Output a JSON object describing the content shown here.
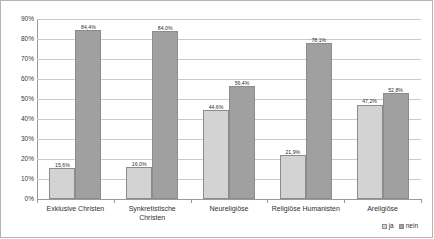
{
  "chart_data": {
    "type": "bar",
    "title": "",
    "subtitle": "",
    "xlabel": "",
    "ylabel": "",
    "ylim": [
      0,
      90
    ],
    "ytick_labels": [
      "90%",
      "80%",
      "70%",
      "60%",
      "50%",
      "40%",
      "30%",
      "20%",
      "10%",
      "0%"
    ],
    "ytick_values": [
      90,
      80,
      70,
      60,
      50,
      40,
      30,
      20,
      10,
      0
    ],
    "grid": true,
    "legend_position": "bottom-right",
    "categories": [
      "Exklusive Christen",
      "Synkretistische Christen",
      "Neureligiöse",
      "Religiöse Humanisten",
      "Areligiöse"
    ],
    "category_lines": [
      [
        "Exklusive Christen"
      ],
      [
        "Synkretistische",
        "Christen"
      ],
      [
        "Neureligiöse"
      ],
      [
        "Religiöse Humanisten"
      ],
      [
        "Areligiöse"
      ]
    ],
    "series": [
      {
        "name": "ja",
        "color": "#d3d3d3",
        "values": [
          15.6,
          16.0,
          44.6,
          21.9,
          47.2
        ],
        "labels": [
          "15,6%",
          "16,0%",
          "44,6%",
          "21,9%",
          "47,2%"
        ]
      },
      {
        "name": "nein",
        "color": "#a0a0a0",
        "values": [
          84.4,
          84.0,
          56.4,
          78.1,
          52.8
        ],
        "labels": [
          "84,4%",
          "84,0%",
          "56,4%",
          "78,1%",
          "52,8%"
        ]
      }
    ]
  },
  "legend": {
    "entries": [
      {
        "label": "ja"
      },
      {
        "label": "nein"
      }
    ]
  },
  "colors": {
    "series_ja": "#d3d3d3",
    "series_nein": "#a0a0a0",
    "gridline": "#c9c9c9",
    "axis": "#9a9a9a",
    "frame": "#b5b5b5",
    "text": "#2f2f2f"
  }
}
